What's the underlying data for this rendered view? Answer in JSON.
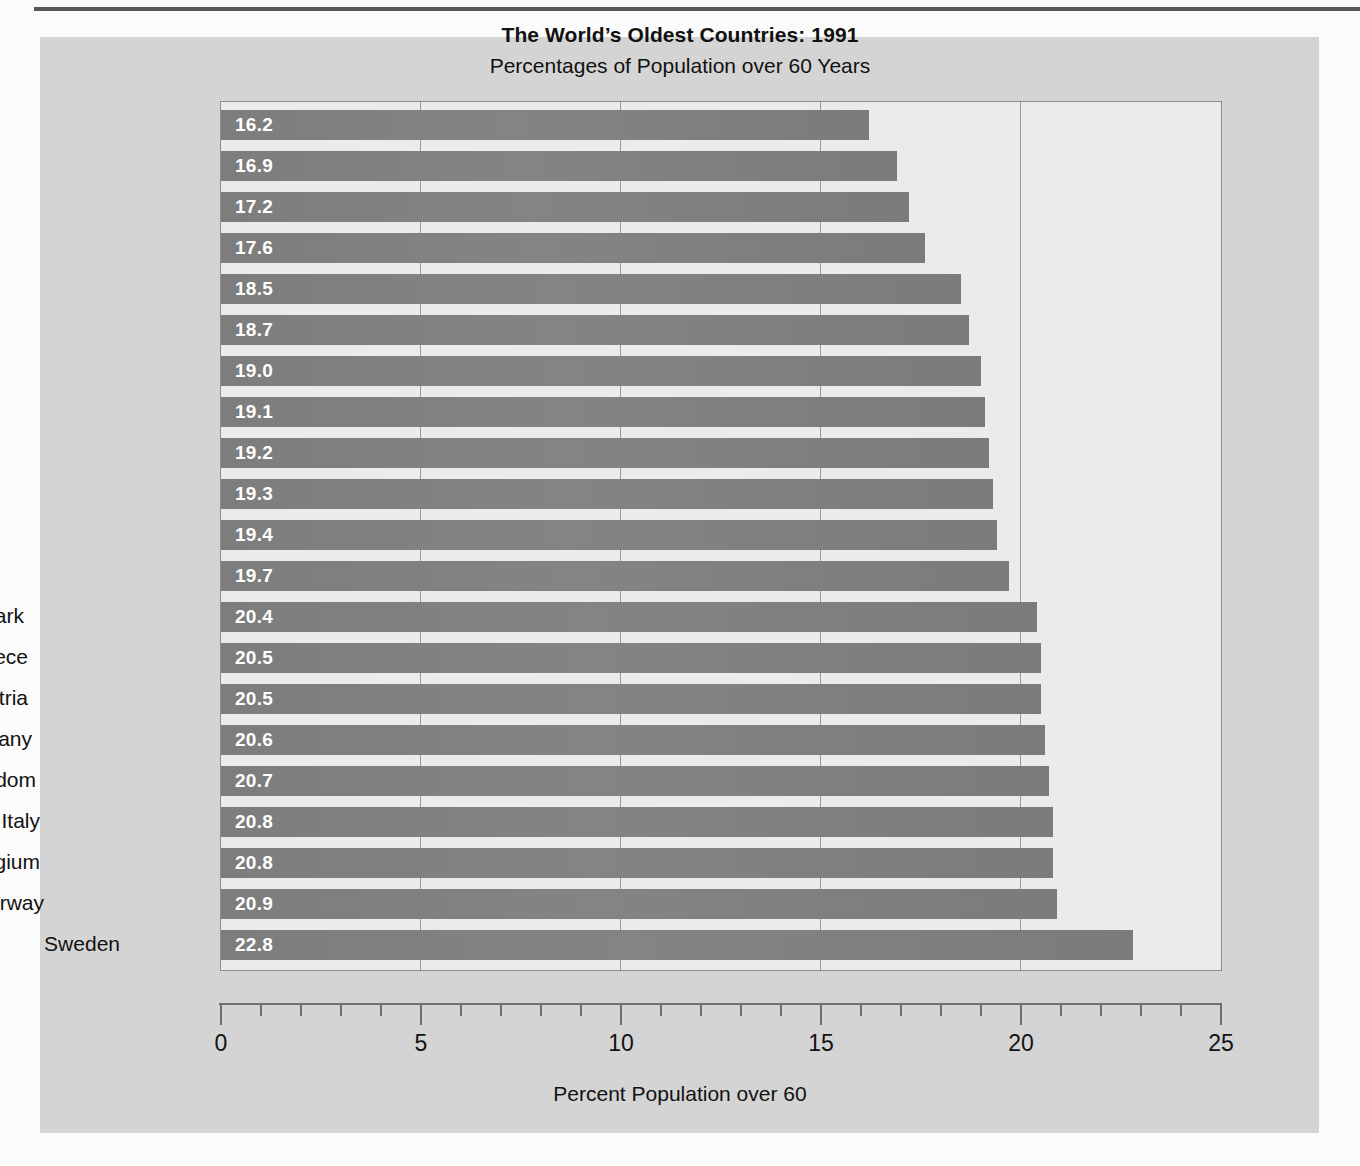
{
  "chart_data": {
    "type": "bar",
    "orientation": "horizontal",
    "title": "The World’s Oldest Countries: 1991",
    "subtitle": "Percentages of Population over 60 Years",
    "xlabel": "Percent Population over 60",
    "ylabel": "",
    "xlim": [
      0,
      25
    ],
    "xticks": [
      0,
      5,
      10,
      15,
      20,
      25
    ],
    "xtick_labels": [
      "0",
      "5",
      "10",
      "15",
      "20",
      "25"
    ],
    "minor_tick_interval": 1,
    "grid": "vertical major gridlines only",
    "legend": "none",
    "value_label_position": "inside bar, left aligned",
    "categories": [
      "Canada",
      "United States",
      "Japan",
      "Netherlands",
      "Portugal",
      "Finland",
      "Spain",
      "Hungary",
      "Bulgaria",
      "Luxembourg",
      "France",
      "Switzerland",
      "Denmark",
      "Greece",
      "Austria",
      "Germany",
      "United Kingdom",
      "Italy",
      "Belgium",
      "Norway",
      "Sweden"
    ],
    "values": [
      16.2,
      16.9,
      17.2,
      17.6,
      18.5,
      18.7,
      19.0,
      19.1,
      19.2,
      19.3,
      19.4,
      19.7,
      20.4,
      20.5,
      20.5,
      20.6,
      20.7,
      20.8,
      20.8,
      20.9,
      22.8
    ],
    "value_labels": [
      "16.2",
      "16.9",
      "17.2",
      "17.6",
      "18.5",
      "18.7",
      "19.0",
      "19.1",
      "19.2",
      "19.3",
      "19.4",
      "19.7",
      "20.4",
      "20.5",
      "20.5",
      "20.6",
      "20.7",
      "20.8",
      "20.8",
      "20.9",
      "22.8"
    ]
  },
  "colors": {
    "bar": "#808080",
    "bar_value_text": "#ffffff",
    "plot_background": "#ebebeb",
    "panel_background": "#d4d4d4",
    "page_background": "#fbfbfb",
    "axis": "#6f6f6f",
    "gridline": "#9a9a9a",
    "text": "#121212"
  }
}
